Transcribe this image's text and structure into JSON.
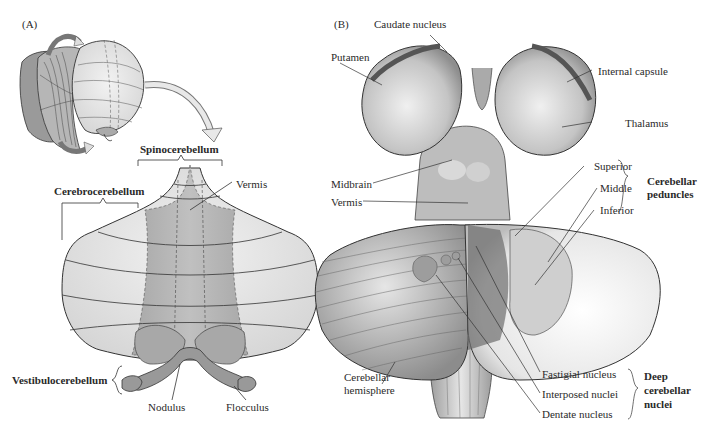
{
  "panel_a": {
    "label": "(A)",
    "regions": {
      "spinocerebellum": "Spinocerebellum",
      "cerebrocerebellum": "Cerebrocerebellum",
      "vestibulocerebellum": "Vestibulocerebellum"
    },
    "parts": {
      "vermis": "Vermis",
      "nodulus": "Nodulus",
      "flocculus": "Flocculus"
    }
  },
  "panel_b": {
    "label": "(B)",
    "structures": {
      "caudate_nucleus": "Caudate nucleus",
      "putamen": "Putamen",
      "internal_capsule": "Internal capsule",
      "thalamus": "Thalamus",
      "midbrain": "Midbrain",
      "vermis": "Vermis",
      "cerebellar_hemisphere_line1": "Cerebellar",
      "cerebellar_hemisphere_line2": "hemisphere"
    },
    "peduncles": {
      "superior": "Superior",
      "middle": "Middle",
      "inferior": "Inferior",
      "group_line1": "Cerebellar",
      "group_line2": "peduncles"
    },
    "deep_nuclei": {
      "fastigial": "Fastigial nucleus",
      "interposed": "Interposed nuclei",
      "dentate": "Dentate nucleus",
      "group_line1": "Deep",
      "group_line2": "cerebellar",
      "group_line3": "nuclei"
    }
  },
  "colors": {
    "hemisphere_light": "#e2e2e2",
    "vermis_mid": "#b4b4b4",
    "vermis_dark": "#9a9a9a",
    "outline": "#333333",
    "brain_shade": "#c8c8c8"
  }
}
